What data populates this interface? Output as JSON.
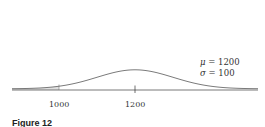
{
  "chart_data": {
    "type": "area",
    "title": "",
    "distribution": "normal",
    "mean": 1200,
    "sd": 100,
    "shaded_region": {
      "from": "-inf",
      "to": 1000
    },
    "tick_labels": [
      "1000",
      "1200"
    ],
    "annotations": [
      "μ = 1200",
      "σ = 100"
    ],
    "xlabel": "",
    "ylabel": "",
    "grid": false
  },
  "labels": {
    "tick_1000": "1000",
    "tick_1200": "1200",
    "mu_symbol": "μ",
    "mu_value": "= 1200",
    "sigma_symbol": "σ",
    "sigma_value": "= 100",
    "caption": "Figure 12"
  },
  "colors": {
    "curve": "#6b6b6b",
    "axis": "#555555",
    "shade": "#e0e0e0"
  }
}
